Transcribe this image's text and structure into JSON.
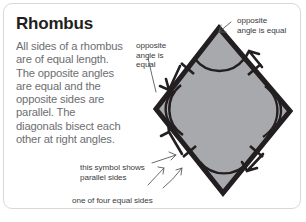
{
  "card": {
    "title": "Rhombus",
    "body": "All sides of a rhombus are of equal length. The opposite angles are equal and the opposite sides are parallel. The diagonals bisect each other at right angles.",
    "border_color": "#d8d8d8",
    "background_color": "#ffffff",
    "title_color": "#231f20",
    "body_color": "#6d6e71"
  },
  "callouts": {
    "top_right": "opposite\nangle is equal",
    "mid_left": "opposite\nangle is\nequal",
    "parallel_sides": "this symbol shows\nparallel sides",
    "equal_sides": "one of four equal sides",
    "text_color": "#3b3b3b"
  },
  "diagram": {
    "shape": "rhombus",
    "fill_color": "#a7a9ac",
    "stroke_color": "#231f20",
    "vertices": {
      "top": [
        218,
        27
      ],
      "right": [
        289,
        110
      ],
      "bottom": [
        222,
        192
      ],
      "left": [
        155,
        108
      ]
    },
    "markings": {
      "side_tick_marks": 4,
      "side_arrow_markers": 4,
      "vertex_arcs_single": [
        "top",
        "bottom"
      ],
      "vertex_arcs_double": [
        "left",
        "right"
      ]
    }
  }
}
